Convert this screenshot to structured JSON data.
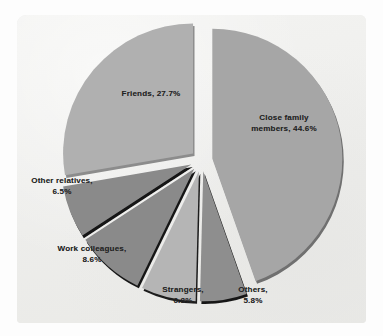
{
  "chart_data": {
    "type": "pie",
    "title": "",
    "subtitle": "",
    "xlabel": "",
    "ylabel": "",
    "legend_position": "none",
    "grid": false,
    "labels_inline": true,
    "exploded": true,
    "start_angle_deg": 0,
    "direction": "clockwise",
    "categories": [
      "Close family members",
      "Others",
      "Strangers",
      "Work colleagues",
      "Other relatives",
      "Friends"
    ],
    "values": [
      44.6,
      5.8,
      6.8,
      8.6,
      6.5,
      27.7
    ],
    "unit": "%",
    "slices": [
      {
        "label": "Close family members",
        "value": 44.6,
        "value_text": "44.6%",
        "label_lines": [
          "Close family",
          "members, 44.6%"
        ],
        "color": "#a6a6a6",
        "shadow_color": "#6f6f6f"
      },
      {
        "label": "Others",
        "value": 5.8,
        "value_text": "5.8%",
        "label_lines": [
          "Others,",
          "5.8%"
        ],
        "color": "#8e8e8e",
        "shadow_color": "#171717"
      },
      {
        "label": "Strangers",
        "value": 6.8,
        "value_text": "6.8%",
        "label_lines": [
          "Strangers,",
          "6.8%"
        ],
        "color": "#b5b5b5",
        "shadow_color": "#1b1b1b"
      },
      {
        "label": "Work colleagues",
        "value": 8.6,
        "value_text": "8.6%",
        "label_lines": [
          "Work colleagues,",
          "8.6%"
        ],
        "color": "#8a8a8a",
        "shadow_color": "#151515"
      },
      {
        "label": "Other relatives",
        "value": 6.5,
        "value_text": "6.5%",
        "label_lines": [
          "Other relatives,",
          "6.5%"
        ],
        "color": "#8a8a8a",
        "shadow_color": "#131313"
      },
      {
        "label": "Friends",
        "value": 27.7,
        "value_text": "27.7%",
        "label_lines": [
          "Friends, 27.7%"
        ],
        "color": "#b0b0b0",
        "shadow_color": "#8c8c8c"
      }
    ]
  },
  "page": {
    "background_color": "#fdfdfd",
    "panel_color": "#f0f0ee",
    "text_color": "#232323"
  }
}
